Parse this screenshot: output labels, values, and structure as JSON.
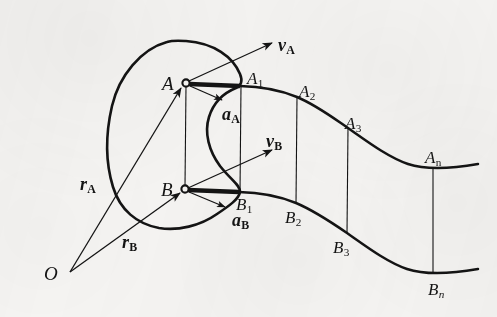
{
  "figure": {
    "kind": "kinematics-diagram",
    "background_color": "#f6f5f3",
    "ink_color": "#141414",
    "origin": {
      "name": "O",
      "label": "O",
      "x": 70,
      "y": 272
    },
    "body": {
      "name": "rigid-body-outline",
      "description": "closed bean shaped lamina containing points A and B"
    },
    "points": [
      {
        "id": "A",
        "label": "A",
        "sub": "",
        "x": 186,
        "y": 83,
        "label_x": 162,
        "label_y": 74,
        "marker": true
      },
      {
        "id": "B",
        "label": "B",
        "sub": "",
        "x": 185,
        "y": 189,
        "label_x": 161,
        "label_y": 180,
        "marker": true
      },
      {
        "id": "A1",
        "label": "A",
        "sub": "1",
        "x": 241,
        "y": 86,
        "label_x": 247,
        "label_y": 70,
        "marker": false
      },
      {
        "id": "A2",
        "label": "A",
        "sub": "2",
        "x": 297,
        "y": 97,
        "label_x": 299,
        "label_y": 83,
        "marker": false
      },
      {
        "id": "A3",
        "label": "A",
        "sub": "3",
        "x": 348,
        "y": 128,
        "label_x": 345,
        "label_y": 115,
        "marker": false
      },
      {
        "id": "An",
        "label": "A",
        "sub": "n",
        "x": 432,
        "y": 168,
        "label_x": 425,
        "label_y": 149,
        "marker": false
      },
      {
        "id": "B1",
        "label": "B",
        "sub": "1",
        "x": 240,
        "y": 192,
        "label_x": 236,
        "label_y": 196,
        "marker": false
      },
      {
        "id": "B2",
        "label": "B",
        "sub": "2",
        "x": 296,
        "y": 199,
        "label_x": 285,
        "label_y": 209,
        "marker": false
      },
      {
        "id": "B3",
        "label": "B",
        "sub": "3",
        "x": 347,
        "y": 232,
        "label_x": 333,
        "label_y": 239,
        "marker": false
      },
      {
        "id": "Bn",
        "label": "B",
        "sub": "n",
        "x": 433,
        "y": 274,
        "label_x": 428,
        "label_y": 281,
        "marker": false
      }
    ],
    "vectors": [
      {
        "id": "rA",
        "label": "r",
        "sub": "A",
        "from": "O",
        "to": "A",
        "label_x": 80,
        "label_y": 175,
        "kind": "position"
      },
      {
        "id": "rB",
        "label": "r",
        "sub": "B",
        "from": "O",
        "to": "B",
        "label_x": 122,
        "label_y": 233,
        "kind": "position"
      },
      {
        "id": "vA",
        "label": "v",
        "sub": "A",
        "from": "A",
        "to": "vA-tip",
        "label_x": 278,
        "label_y": 36,
        "kind": "velocity"
      },
      {
        "id": "vB",
        "label": "v",
        "sub": "B",
        "from": "B",
        "to": "vB-tip",
        "label_x": 266,
        "label_y": 132,
        "kind": "velocity"
      },
      {
        "id": "aA",
        "label": "a",
        "sub": "A",
        "from": "A",
        "to": "aA-tip",
        "label_x": 222,
        "label_y": 105,
        "kind": "acceleration"
      },
      {
        "id": "aB",
        "label": "a",
        "sub": "B",
        "from": "B",
        "to": "aB-tip",
        "label_x": 232,
        "label_y": 211,
        "kind": "acceleration"
      }
    ],
    "connectors": [
      {
        "id": "A-B",
        "from": "A",
        "to": "B",
        "weight": "thin"
      },
      {
        "id": "A-A1",
        "from": "A",
        "to": "A1",
        "weight": "thick"
      },
      {
        "id": "B-B1",
        "from": "B",
        "to": "B1",
        "weight": "thick"
      },
      {
        "id": "A1-B1",
        "from": "A1",
        "to": "B1",
        "weight": "thin"
      },
      {
        "id": "A2-B2",
        "from": "A2",
        "to": "B2",
        "weight": "thin"
      },
      {
        "id": "A3-B3",
        "from": "A3",
        "to": "B3",
        "weight": "thin"
      },
      {
        "id": "An-Bn",
        "from": "An",
        "to": "Bn",
        "weight": "thin"
      }
    ],
    "paths": [
      {
        "id": "trajectory-A",
        "label": "path of point A",
        "weight": "thick"
      },
      {
        "id": "trajectory-B",
        "label": "path of point B",
        "weight": "thick"
      }
    ]
  }
}
